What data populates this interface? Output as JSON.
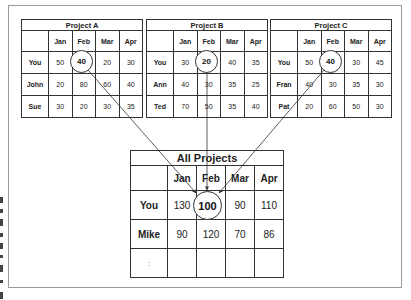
{
  "months": [
    "Jan",
    "Feb",
    "Mar",
    "Apr"
  ],
  "project_a": {
    "title": "Project A",
    "rows": [
      {
        "name": "You",
        "values": [
          "50",
          "40",
          "20",
          "30"
        ]
      },
      {
        "name": "John",
        "values": [
          "20",
          "80",
          "60",
          "40"
        ]
      },
      {
        "name": "Sue",
        "values": [
          "30",
          "20",
          "30",
          "35"
        ]
      }
    ],
    "highlight": "40"
  },
  "project_b": {
    "title": "Project B",
    "rows": [
      {
        "name": "You",
        "values": [
          "30",
          "20",
          "40",
          "35"
        ]
      },
      {
        "name": "Ann",
        "values": [
          "40",
          "30",
          "35",
          "25"
        ]
      },
      {
        "name": "Ted",
        "values": [
          "70",
          "50",
          "35",
          "40"
        ]
      }
    ],
    "highlight": "20"
  },
  "project_c": {
    "title": "Project C",
    "rows": [
      {
        "name": "You",
        "values": [
          "50",
          "40",
          "30",
          "45"
        ]
      },
      {
        "name": "Fran",
        "values": [
          "40",
          "30",
          "35",
          "30"
        ]
      },
      {
        "name": "Pat",
        "values": [
          "20",
          "60",
          "50",
          "30"
        ]
      }
    ],
    "highlight": "40"
  },
  "all_projects": {
    "title": "All Projects",
    "rows": [
      {
        "name": "You",
        "values": [
          "130",
          "100",
          "90",
          "110"
        ]
      },
      {
        "name": "Mike",
        "values": [
          "90",
          "120",
          "70",
          "86"
        ]
      },
      {
        "name": ":",
        "values": [
          "",
          "",
          "",
          ""
        ]
      }
    ],
    "highlight": "100"
  }
}
